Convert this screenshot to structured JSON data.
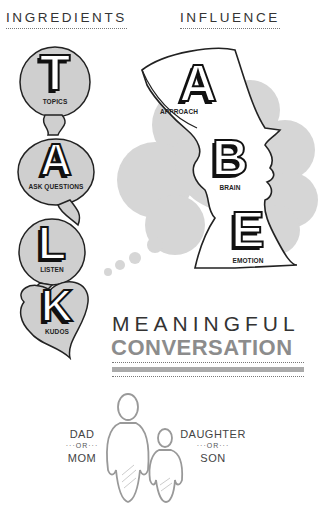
{
  "headers": {
    "left": "INGREDIENTS",
    "right": "INFLUENCE"
  },
  "talk": [
    {
      "letter": "T",
      "label": "TOPICS"
    },
    {
      "letter": "A",
      "label": "ASK QUESTIONS"
    },
    {
      "letter": "L",
      "label": "LISTEN"
    },
    {
      "letter": "K",
      "label": "KUDOS"
    }
  ],
  "abe": [
    {
      "letter": "A",
      "label": "APPROACH"
    },
    {
      "letter": "B",
      "label": "BRAIN"
    },
    {
      "letter": "E",
      "label": "EMOTION"
    }
  ],
  "result": {
    "line1": "MEANINGFUL",
    "line2": "CONVERSATION"
  },
  "family": {
    "left_top": "DAD",
    "left_or": "···OR···",
    "left_bottom": "MOM",
    "right_top": "DAUGHTER",
    "right_or": "···OR···",
    "right_bottom": "SON"
  },
  "colors": {
    "bubble_fill": "#cfcfcf",
    "cloud_fill": "#d6d6d6",
    "conversation_gray": "#8c8c8c",
    "ink": "#111111"
  }
}
